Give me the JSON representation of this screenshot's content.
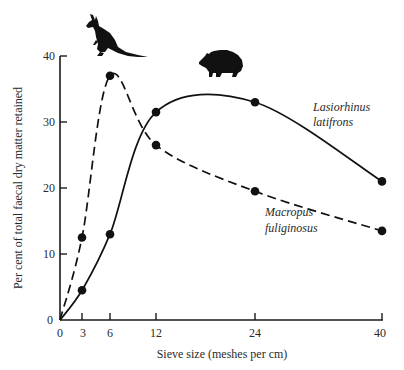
{
  "chart_data": {
    "type": "line",
    "title": "",
    "xlabel": "Sieve size (meshes per  cm)",
    "ylabel": "Per cent of total faecal dry matter retained",
    "x_ticks": [
      0,
      3,
      6,
      12,
      24,
      40
    ],
    "y_ticks": [
      0,
      10,
      20,
      30,
      40
    ],
    "xlim": [
      0,
      40
    ],
    "ylim": [
      0,
      40
    ],
    "grid": false,
    "legend": "inline labels next to curves",
    "series": [
      {
        "name": "Lasiorhinus latifrons",
        "label_lines": [
          "Lasiorhinus",
          "latifrons"
        ],
        "line_style": "solid",
        "icon": "wombat-silhouette",
        "x": [
          0,
          3,
          6,
          12,
          24,
          40
        ],
        "y": [
          0,
          4.5,
          13,
          31.5,
          33,
          21
        ],
        "markers_at": [
          3,
          6,
          12,
          24,
          40
        ]
      },
      {
        "name": "Macropus fuliginosus",
        "label_lines": [
          "Macropus",
          "fuliginosus"
        ],
        "line_style": "dashed",
        "icon": "kangaroo-silhouette",
        "x": [
          0,
          3,
          6,
          12,
          24,
          40
        ],
        "y": [
          0,
          12.5,
          37,
          26.5,
          19.5,
          13.5
        ],
        "markers_at": [
          3,
          6,
          12,
          24,
          40
        ]
      }
    ]
  },
  "axes": {
    "x_title": "Sieve size (meshes per  cm)",
    "y_title": "Per cent of total faecal dry matter retained",
    "x_tick_labels": [
      "0",
      "3",
      "6",
      "12",
      "24",
      "40"
    ],
    "y_tick_labels": [
      "0",
      "10",
      "20",
      "30",
      "40"
    ]
  },
  "labels": {
    "lasiorhinus_1": "Lasiorhinus",
    "lasiorhinus_2": "latifrons",
    "macropus_1": "Macropus",
    "macropus_2": "fuliginosus"
  },
  "icons": {
    "kangaroo": "kangaroo-silhouette",
    "wombat": "wombat-silhouette"
  },
  "colors": {
    "ink": "#111111",
    "background": "#ffffff"
  }
}
